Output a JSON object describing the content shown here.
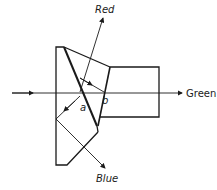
{
  "diagram": {
    "type": "dichroic prism beam splitter",
    "labels": {
      "red": "Red",
      "green": "Green",
      "blue": "Blue",
      "a": "a",
      "b": "b"
    },
    "colors": {
      "line": "#1a1a1a",
      "background": "#ffffff"
    }
  }
}
